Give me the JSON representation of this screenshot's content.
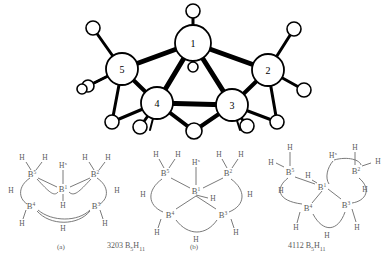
{
  "figure": {
    "background_color": "#ffffff",
    "ink_color": "#000000",
    "line_color": "#6b6b6b"
  },
  "top_structure": {
    "name": "B5H11 ball-and-stick cage",
    "boron_labels": [
      "1",
      "2",
      "3",
      "4",
      "5"
    ],
    "atoms": [
      {
        "label": "1",
        "cx": 193,
        "cy": 43,
        "r": 18
      },
      {
        "label": "2",
        "cx": 268,
        "cy": 70,
        "r": 16
      },
      {
        "label": "3",
        "cx": 232,
        "cy": 105,
        "r": 16
      },
      {
        "label": "4",
        "cx": 157,
        "cy": 103,
        "r": 16
      },
      {
        "label": "5",
        "cx": 122,
        "cy": 69,
        "r": 16
      }
    ],
    "hydrogens": [
      {
        "cx": 193,
        "cy": 11,
        "r": 7
      },
      {
        "cx": 193,
        "cy": 67,
        "r": 5
      },
      {
        "cx": 294,
        "cy": 29,
        "r": 7
      },
      {
        "cx": 304,
        "cy": 90,
        "r": 7
      },
      {
        "cx": 277,
        "cy": 122,
        "r": 7
      },
      {
        "cx": 247,
        "cy": 126,
        "r": 7
      },
      {
        "cx": 194,
        "cy": 131,
        "r": 8
      },
      {
        "cx": 140,
        "cy": 127,
        "r": 7
      },
      {
        "cx": 112,
        "cy": 122,
        "r": 7
      },
      {
        "cx": 93,
        "cy": 28,
        "r": 7
      },
      {
        "cx": 88,
        "cy": 86,
        "r": 6
      },
      {
        "cx": 82,
        "cy": 89,
        "r": 5
      }
    ]
  },
  "diagram_a": {
    "caption": "(a)",
    "boron_labels": [
      "B",
      "B",
      "B",
      "B",
      "B"
    ],
    "atoms": [
      {
        "element": "B",
        "sup": "5",
        "x": 32,
        "y": 174
      },
      {
        "element": "B",
        "sup": "2",
        "x": 95,
        "y": 174
      },
      {
        "element": "B",
        "sup": "1",
        "x": 63,
        "y": 190
      },
      {
        "element": "B",
        "sup": "4",
        "x": 31,
        "y": 206
      },
      {
        "element": "B",
        "sup": "3",
        "x": 95,
        "y": 206
      }
    ],
    "hydrogens": [
      {
        "label": "H",
        "x": 22,
        "y": 157
      },
      {
        "label": "H",
        "x": 44,
        "y": 157
      },
      {
        "label": "H",
        "x": 85,
        "y": 157
      },
      {
        "label": "H",
        "x": 106,
        "y": 157
      },
      {
        "label": "H",
        "sup": "x",
        "x": 63,
        "y": 166
      },
      {
        "label": "H",
        "x": 63,
        "y": 205
      },
      {
        "label": "H",
        "x": 10,
        "y": 190
      },
      {
        "label": "H",
        "x": 116,
        "y": 190
      },
      {
        "label": "H",
        "x": 22,
        "y": 224
      },
      {
        "label": "H",
        "x": 104,
        "y": 224
      },
      {
        "label": "H",
        "x": 63,
        "y": 229
      }
    ]
  },
  "diagram_b": {
    "caption": "(b)",
    "atoms": [
      {
        "element": "B",
        "sup": "5",
        "x": 165,
        "y": 173
      },
      {
        "element": "B",
        "sup": "2",
        "x": 228,
        "y": 173
      },
      {
        "element": "B",
        "sup": "1",
        "x": 196,
        "y": 192
      },
      {
        "element": "B",
        "sup": "4",
        "x": 170,
        "y": 215
      },
      {
        "element": "B",
        "sup": "3",
        "x": 222,
        "y": 215
      }
    ],
    "hydrogens": [
      {
        "label": "H",
        "x": 155,
        "y": 154
      },
      {
        "label": "H",
        "x": 177,
        "y": 154
      },
      {
        "label": "H",
        "x": 217,
        "y": 154
      },
      {
        "label": "H",
        "x": 239,
        "y": 154
      },
      {
        "label": "H",
        "sup": "x",
        "x": 196,
        "y": 163
      },
      {
        "label": "H",
        "x": 212,
        "y": 199
      },
      {
        "label": "H",
        "x": 143,
        "y": 195
      },
      {
        "label": "H",
        "x": 249,
        "y": 195
      },
      {
        "label": "H",
        "x": 157,
        "y": 233
      },
      {
        "label": "H",
        "x": 234,
        "y": 233
      },
      {
        "label": "H",
        "x": 196,
        "y": 240
      }
    ]
  },
  "diagram_c": {
    "caption": "",
    "atoms": [
      {
        "element": "B",
        "sup": "5",
        "x": 290,
        "y": 172
      },
      {
        "element": "B",
        "sup": "2",
        "x": 355,
        "y": 171
      },
      {
        "element": "B",
        "sup": "1",
        "x": 322,
        "y": 187
      },
      {
        "element": "B",
        "sup": "4",
        "x": 308,
        "y": 208
      },
      {
        "element": "B",
        "sup": "3",
        "x": 345,
        "y": 205
      }
    ],
    "hydrogens": [
      {
        "label": "H",
        "x": 290,
        "y": 148
      },
      {
        "label": "H",
        "x": 270,
        "y": 162
      },
      {
        "label": "H",
        "x": 355,
        "y": 148
      },
      {
        "label": "H",
        "x": 376,
        "y": 161
      },
      {
        "label": "H",
        "sup": "x",
        "x": 339,
        "y": 157
      },
      {
        "label": "H",
        "x": 307,
        "y": 176
      },
      {
        "label": "H",
        "x": 281,
        "y": 191
      },
      {
        "label": "H",
        "x": 364,
        "y": 190
      },
      {
        "label": "H",
        "x": 297,
        "y": 228
      },
      {
        "label": "H",
        "x": 356,
        "y": 228
      },
      {
        "label": "H",
        "x": 327,
        "y": 236
      }
    ]
  },
  "captions": {
    "label_a": "(a)",
    "label_b": "(b)",
    "formula_left_prefix": "3203",
    "formula_left_element": "B",
    "formula_left_sub1": "5",
    "formula_left_h": "H",
    "formula_left_sub2": "11",
    "formula_right_prefix": "4112",
    "formula_right_element": "B",
    "formula_right_sub1": "5",
    "formula_right_h": "H",
    "formula_right_sub2": "11"
  }
}
